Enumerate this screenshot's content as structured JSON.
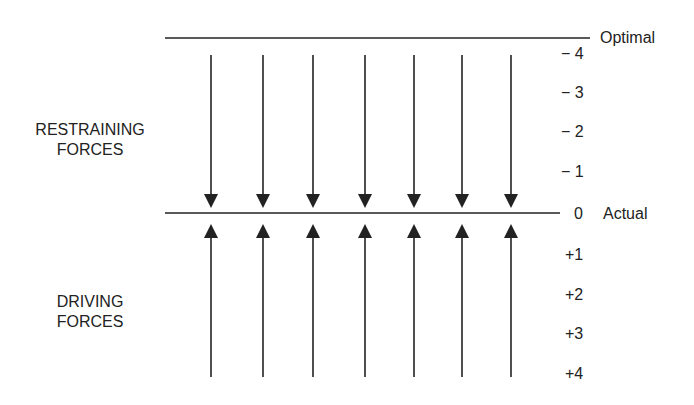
{
  "diagram": {
    "restraining_label": [
      "RESTRAINING",
      "FORCES"
    ],
    "driving_label": [
      "DRIVING",
      "FORCES"
    ],
    "top_line_label": "Optimal",
    "mid_line_label": "Actual",
    "scale_restraining": [
      "− 4",
      "− 3",
      "− 2",
      "− 1"
    ],
    "scale_zero": "0",
    "scale_driving": [
      "+1",
      "+2",
      "+3",
      "+4"
    ],
    "arrow_count": 7,
    "arrow_x": [
      211,
      263,
      313,
      365,
      414,
      462,
      511
    ],
    "colors": {
      "line": "#222222",
      "text": "#222222",
      "background": "#ffffff"
    }
  }
}
